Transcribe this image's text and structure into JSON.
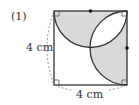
{
  "figure": {
    "problem_number": "(1)",
    "left_side_label": "4 cm",
    "bottom_side_label": "4 cm",
    "shape": "square",
    "side_length": "4 cm",
    "colors": {
      "shade": "#d9d9d9",
      "stroke": "#333333",
      "dashed": "#777777"
    },
    "elements": [
      "square with right-angle markers at all four corners",
      "semicircle on top edge centered at top-edge midpoint (dot)",
      "semicircle on right edge centered at right-edge midpoint (dot)",
      "shaded semicircle regions, overlapping lens unshaded"
    ]
  }
}
